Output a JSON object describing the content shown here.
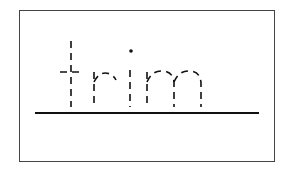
{
  "worksheet": {
    "word": "trim",
    "letters": [
      "t",
      "r",
      "i",
      "m"
    ],
    "style": "dashed-trace",
    "colors": {
      "stroke": "#111111",
      "border": "#444444",
      "background": "#ffffff"
    }
  }
}
